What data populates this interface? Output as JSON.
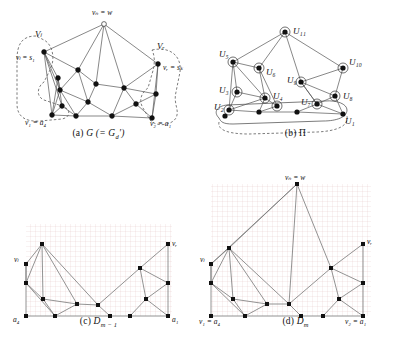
{
  "figure": {
    "panels": [
      {
        "id": "a",
        "caption_prefix": "(a)",
        "caption_main": "G (= G",
        "caption_sub": "d",
        "caption_suffix": "′)",
        "labels": {
          "top": "vₙ = w",
          "Vl": "Vₗ",
          "Vr": "Vᵣ",
          "left_top": "vₗ = s₁",
          "right_top": "vᵣ = sₖ",
          "left_bottom": "v₁ = a₄",
          "right_bottom": "v₂ = a₁"
        }
      },
      {
        "id": "b",
        "caption_prefix": "(b)",
        "caption_main": "Π",
        "labels": {
          "U11": "U₁₁",
          "U10": "U₁₀",
          "U9": "U₉",
          "U8": "U₈",
          "U7": "U₇",
          "U6": "U₆",
          "U5": "U₅",
          "U4": "U₄",
          "U3": "U₃",
          "U2": "U₂",
          "U1": "U₁"
        }
      },
      {
        "id": "c",
        "caption_prefix": "(c)",
        "caption_main": "D",
        "caption_sub": "m − 1",
        "labels": {
          "vl": "vₗ",
          "vr": "vᵣ",
          "a4": "a₄",
          "a1": "a₁"
        }
      },
      {
        "id": "d",
        "caption_prefix": "(d)",
        "caption_main": "D",
        "caption_sub": "m",
        "labels": {
          "top": "vₙ = w",
          "vl": "vₗ",
          "vr": "vᵣ",
          "left_bottom": "v₁ = a₄",
          "right_bottom": "v₂ = a₁"
        }
      }
    ],
    "colors": {
      "ink": "#111111",
      "node_fill": "#111111",
      "node_hollow": "#ffffff",
      "edge": "#555555",
      "grid": "#d9b9b9",
      "dashed_region": "#444444",
      "background": "#ffffff"
    }
  }
}
